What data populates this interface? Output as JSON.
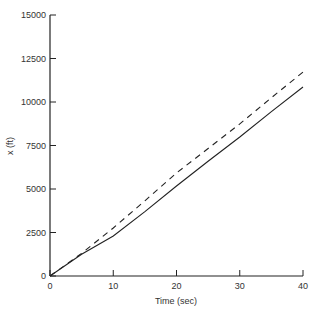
{
  "chart_data": {
    "type": "line",
    "title": "",
    "xlabel": "Time (sec)",
    "ylabel": "x (ft)",
    "xlim": [
      0,
      40
    ],
    "ylim": [
      0,
      15000
    ],
    "xticks": [
      0,
      10,
      20,
      30,
      40
    ],
    "yticks": [
      0,
      2500,
      5000,
      7500,
      10000,
      12500,
      15000
    ],
    "grid": false,
    "legend": null,
    "series": [
      {
        "name": "solid",
        "style": "solid",
        "x": [
          0,
          5,
          10,
          15,
          20,
          25,
          30,
          35,
          40
        ],
        "y": [
          0,
          1250,
          2300,
          3700,
          5170,
          6600,
          7990,
          9450,
          10860
        ]
      },
      {
        "name": "dashed",
        "style": "dashed",
        "x": [
          0,
          5,
          10,
          15,
          20,
          25,
          30,
          35,
          40
        ],
        "y": [
          0,
          1300,
          2760,
          4320,
          5920,
          7330,
          8740,
          10250,
          11720
        ]
      }
    ]
  }
}
